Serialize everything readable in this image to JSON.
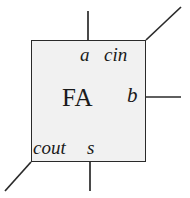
{
  "diagram": {
    "title": "FA",
    "block": {
      "label": "FA",
      "fill_color": "#f1f1f1",
      "stroke_color": "#2a2a2a",
      "x": 31,
      "y": 40,
      "width": 115,
      "height": 122
    },
    "background_color": "#ffffff",
    "wire_color": "#2a2a2a",
    "ports": [
      {
        "name": "a",
        "label": "a",
        "style": "italic",
        "side": "top",
        "wire": {
          "type": "line",
          "x1": 88,
          "y1": 11,
          "x2": 88,
          "y2": 40
        }
      },
      {
        "name": "cin",
        "label": "cin",
        "style": "italic",
        "side": "top-right",
        "wire": {
          "type": "line",
          "x1": 146,
          "y1": 40,
          "x2": 181,
          "y2": 7
        }
      },
      {
        "name": "b",
        "label": "b",
        "style": "italic",
        "side": "right",
        "wire": {
          "type": "line",
          "x1": 146,
          "y1": 97,
          "x2": 181,
          "y2": 97
        }
      },
      {
        "name": "cout",
        "label": "cout",
        "style": "italic",
        "side": "bottom-left",
        "wire": {
          "type": "line",
          "x1": 31,
          "y1": 162,
          "x2": 5,
          "y2": 191
        }
      },
      {
        "name": "s",
        "label": "s",
        "style": "italic",
        "side": "bottom",
        "wire": {
          "type": "line",
          "x1": 90,
          "y1": 162,
          "x2": 90,
          "y2": 191
        }
      }
    ]
  }
}
